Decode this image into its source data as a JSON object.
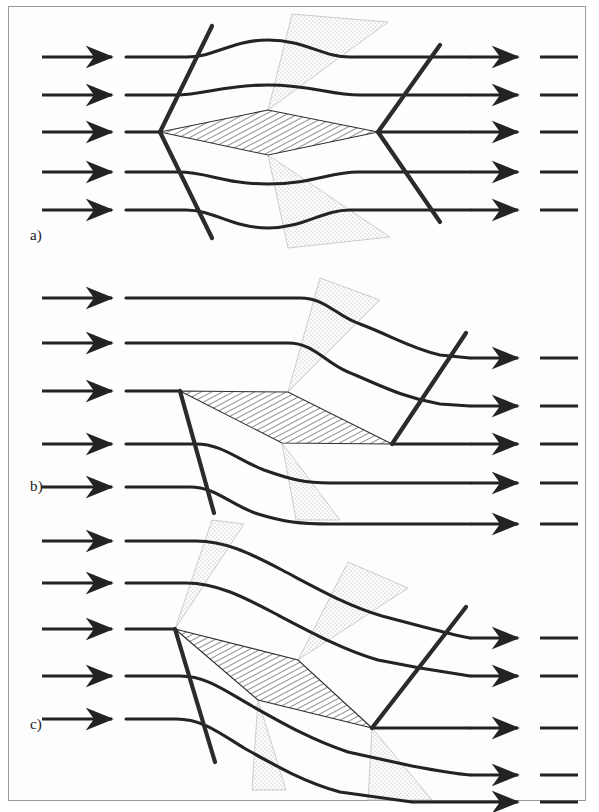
{
  "figure": {
    "background_color": "#ffffff",
    "frame_color": "#9a9a9a",
    "shock_color": "#2b2b2b",
    "streamline_color": "#232323",
    "expansion_fan_color": "#b9b9b9",
    "hatch_color": "#3a3a3a",
    "width": 599,
    "height": 812
  },
  "panels": [
    {
      "label": "a)",
      "label_x": 30,
      "label_y": 227,
      "description": "Symmetric diamond airfoil at zero angle of attack",
      "angle_of_attack_deg": 0,
      "inlet_arrow_rows_y": [
        57,
        95,
        132,
        172,
        210
      ],
      "leading_edge": [
        160,
        132
      ],
      "trailing_edge": [
        378,
        132
      ],
      "upper_apex": [
        268,
        110
      ],
      "lower_apex": [
        268,
        155
      ],
      "shock_count": 4,
      "expansion_fan_count": 2
    },
    {
      "label": "b)",
      "label_x": 30,
      "label_y": 478,
      "description": "Diamond airfoil at moderate angle of attack, attached leading edge shock on lower surface only",
      "angle_of_attack_deg": 12,
      "inlet_arrow_rows_y": [
        298,
        343,
        391,
        444,
        487
      ],
      "leading_edge": [
        180,
        391
      ],
      "trailing_edge": [
        392,
        444
      ],
      "upper_apex": [
        288,
        392
      ],
      "lower_apex": [
        282,
        443
      ],
      "shock_count": 2,
      "expansion_fan_count": 2
    },
    {
      "label": "c)",
      "label_x": 30,
      "label_y": 716,
      "description": "Diamond airfoil at angle of attack with shocks and expansion fans on both surfaces",
      "angle_of_attack_deg": 16,
      "inlet_arrow_rows_y": [
        541,
        583,
        629,
        676,
        719
      ],
      "leading_edge": [
        175,
        629
      ],
      "trailing_edge": [
        372,
        728
      ],
      "upper_apex": [
        298,
        660
      ],
      "lower_apex": [
        258,
        700
      ],
      "shock_count": 3,
      "expansion_fan_count": 3
    }
  ],
  "legend_terms": {
    "shock": "oblique shock wave",
    "expansion": "expansion fan",
    "airfoil": "diamond airfoil section",
    "streamline": "streamline"
  }
}
